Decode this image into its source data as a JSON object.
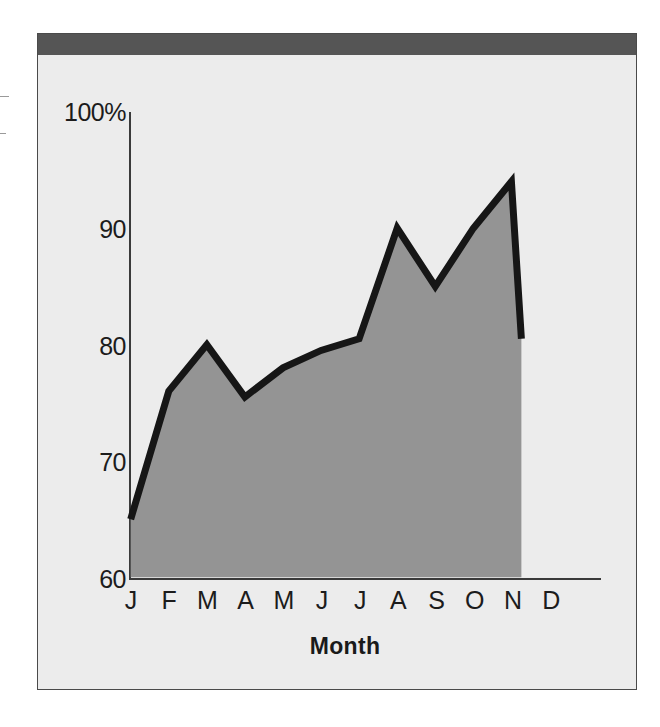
{
  "chart_data": {
    "type": "area",
    "title": "",
    "subtitle": "",
    "xlabel": "Month",
    "ylabel": "",
    "categories": [
      "J",
      "F",
      "M",
      "A",
      "M",
      "J",
      "J",
      "A",
      "S",
      "O",
      "N",
      "D"
    ],
    "category_names": [
      "January",
      "February",
      "March",
      "April",
      "May",
      "June",
      "July",
      "August",
      "September",
      "October",
      "November",
      "December"
    ],
    "values": [
      65,
      76,
      80,
      75.5,
      78,
      79.5,
      80.5,
      90,
      85,
      90,
      94,
      83
    ],
    "series": [
      {
        "name": "Percent",
        "values": [
          65,
          76,
          80,
          75.5,
          78,
          79.5,
          80.5,
          90,
          85,
          90,
          94,
          83
        ]
      }
    ],
    "note_last_point": "Series line and fill terminate at N (November); D (December) tick has no plotted value",
    "ylim": [
      60,
      100
    ],
    "xlim_labels": [
      "J",
      "D"
    ],
    "y_ticks": [
      60,
      70,
      80,
      90,
      100
    ],
    "y_tick_labels": [
      "60",
      "70",
      "80",
      "90",
      "100%"
    ],
    "y_unit": "%",
    "grid": false,
    "legend": "none",
    "fill_color": "#949494",
    "line_color": "#161616",
    "axis_color": "#3a3a3a",
    "plot_background": "#ececec",
    "header_bar_color": "#555555",
    "frame_border_color": "#4a4a4a"
  },
  "axis_labels": {
    "y": [
      {
        "text": "100%",
        "value": 100
      },
      {
        "text": "90",
        "value": 90
      },
      {
        "text": "80",
        "value": 80
      },
      {
        "text": "70",
        "value": 70
      },
      {
        "text": "60",
        "value": 60
      }
    ],
    "x": [
      {
        "text": "J"
      },
      {
        "text": "F"
      },
      {
        "text": "M"
      },
      {
        "text": "A"
      },
      {
        "text": "M"
      },
      {
        "text": "J"
      },
      {
        "text": "J"
      },
      {
        "text": "A"
      },
      {
        "text": "S"
      },
      {
        "text": "O"
      },
      {
        "text": "N"
      },
      {
        "text": "D"
      }
    ],
    "x_title": "Month"
  }
}
